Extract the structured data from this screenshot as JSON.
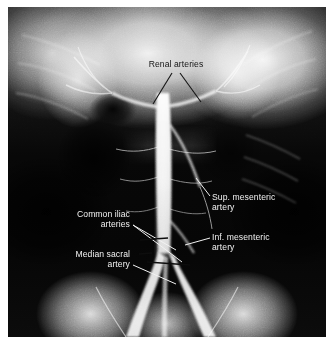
{
  "figure": {
    "kind": "abdominal-aortogram-radiograph",
    "modality_note": "Translumbar aortogram, anteroposterior projection",
    "plate": {
      "x": 8,
      "y": 7,
      "width": 318,
      "height": 330,
      "background_color": "#0a0a0a",
      "margin_color": "#ffffff"
    }
  },
  "annotations": [
    {
      "id": "renal-arteries",
      "text": "Renal arteries",
      "text_color": "#141414",
      "align": "center",
      "x": 132,
      "y": 59,
      "width": 88,
      "leaders": [
        {
          "x1": 172,
          "y1": 73,
          "x2": 153,
          "y2": 104
        },
        {
          "x1": 180,
          "y1": 73,
          "x2": 201,
          "y2": 102
        }
      ],
      "leader_color": "#141414",
      "leader_width": 1.1
    },
    {
      "id": "sup-mesenteric-artery",
      "text": "Sup. mesenteric\nartery",
      "text_color": "#f2f2f2",
      "align": "left",
      "x": 212,
      "y": 192,
      "width": 100,
      "leaders": [
        {
          "x1": 210,
          "y1": 196,
          "x2": 196,
          "y2": 178
        }
      ],
      "leader_color": "#f2f2f2",
      "leader_width": 1.0
    },
    {
      "id": "inf-mesenteric-artery",
      "text": "Inf. mesenteric\nartery",
      "text_color": "#f2f2f2",
      "align": "left",
      "x": 212,
      "y": 232,
      "width": 100,
      "leaders": [
        {
          "x1": 210,
          "y1": 238,
          "x2": 185,
          "y2": 245
        }
      ],
      "leader_color": "#f2f2f2",
      "leader_width": 1.0
    },
    {
      "id": "common-iliac-arteries",
      "text": "Common iliac\narteries",
      "text_color": "#f2f2f2",
      "align": "right",
      "x": 36,
      "y": 209,
      "width": 94,
      "leaders": [
        {
          "x1": 133,
          "y1": 225,
          "x2": 176,
          "y2": 250
        },
        {
          "x1": 133,
          "y1": 225,
          "x2": 182,
          "y2": 262
        }
      ],
      "leader_color": "#f2f2f2",
      "leader_width": 1.0
    },
    {
      "id": "median-sacral-artery",
      "text": "Median sacral\nartery",
      "text_color": "#f2f2f2",
      "align": "right",
      "x": 36,
      "y": 249,
      "width": 94,
      "leaders": [
        {
          "x1": 133,
          "y1": 265,
          "x2": 176,
          "y2": 284
        }
      ],
      "leader_color": "#f2f2f2",
      "leader_width": 1.0
    }
  ],
  "dark_leaders": [
    {
      "id": "iliac-tip-upper",
      "x1": 140,
      "y1": 240,
      "x2": 168,
      "y2": 238
    },
    {
      "id": "iliac-tip-lower",
      "x1": 139,
      "y1": 254,
      "x2": 152,
      "y2": 253
    },
    {
      "id": "bifurcation-bar",
      "x1": 147,
      "y1": 262,
      "x2": 190,
      "y2": 265
    }
  ],
  "anatomy_paths": {
    "aorta_label": "abdominal aorta",
    "right_iliac_label": "right common iliac artery",
    "left_iliac_label": "left common iliac artery",
    "median_sacral_label": "median sacral artery"
  }
}
